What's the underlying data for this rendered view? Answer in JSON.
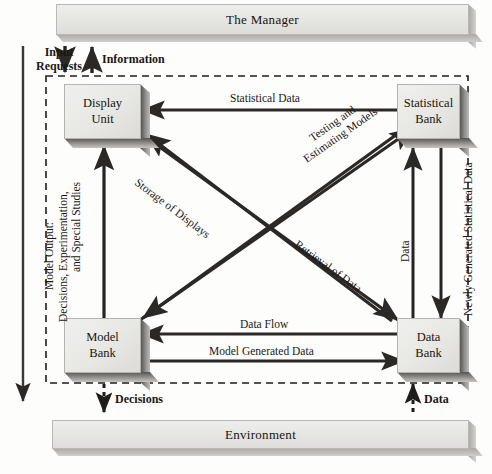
{
  "diagram": {
    "colors": {
      "box_fill": "#e7e7e4",
      "box_edge": "#b4b3af",
      "shadow": "#54534f",
      "arrow": "#2b2926",
      "dashed_border": "#1f1d1a",
      "page_background": "#fdfdfc"
    }
  },
  "bars": {
    "manager": {
      "label": "The Manager"
    },
    "environment": {
      "label": "Environment"
    }
  },
  "nodes": {
    "display_unit": {
      "line1": "Display",
      "line2": "Unit"
    },
    "statistical_bank": {
      "line1": "Statistical",
      "line2": "Bank"
    },
    "model_bank": {
      "line1": "Model",
      "line2": "Bank"
    },
    "data_bank": {
      "line1": "Data",
      "line2": "Bank"
    }
  },
  "flow_labels": {
    "input_requests_line1": "Input",
    "input_requests_line2": "Requests",
    "information": "Information",
    "statistical_data": "Statistical Data",
    "storage_of_displays": "Storage of Displays",
    "testing_line1": "Testing and",
    "testing_line2": "Estimating Models",
    "retrieval_of_data": "Retrieval of Data",
    "data_vertical": "Data",
    "newly_generated": "Newly Generated Statistical Data",
    "data_flow": "Data Flow",
    "model_generated_data": "Model Generated Data",
    "decisions": "Decisions",
    "data_bottom": "Data",
    "model_output_line1": "Model Output:",
    "model_output_line2": "Decisions, Experimentation,",
    "model_output_line3": "and Special Studies"
  }
}
